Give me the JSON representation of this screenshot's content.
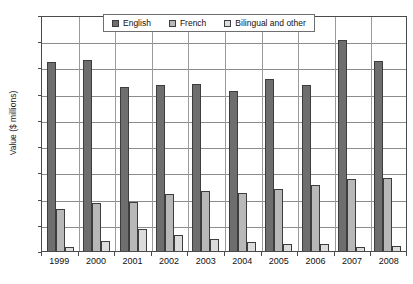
{
  "chart_data": {
    "type": "bar",
    "title": "",
    "xlabel": "",
    "ylabel": "Value ($ millions)",
    "ylim": [
      0,
      1800
    ],
    "ytick_step": 200,
    "yticks": [
      "1,800",
      "1,600",
      "1,400",
      "1,200",
      "1,000",
      "800",
      "600",
      "400",
      "200",
      "0"
    ],
    "grid": true,
    "legend_position": "top-center",
    "categories": [
      "1999",
      "2000",
      "2001",
      "2002",
      "2003",
      "2004",
      "2005",
      "2006",
      "2007",
      "2008"
    ],
    "series": [
      {
        "name": "English",
        "color": "#6e6e6e",
        "values": [
          1440,
          1460,
          1250,
          1265,
          1275,
          1220,
          1310,
          1265,
          1610,
          1450
        ]
      },
      {
        "name": "French",
        "color": "#b8b8b8",
        "values": [
          320,
          370,
          375,
          435,
          455,
          440,
          470,
          505,
          550,
          555
        ]
      },
      {
        "name": "Bilingual and other",
        "color": "#dcdcdc",
        "values": [
          30,
          75,
          170,
          120,
          90,
          65,
          55,
          55,
          30,
          40
        ]
      }
    ]
  }
}
